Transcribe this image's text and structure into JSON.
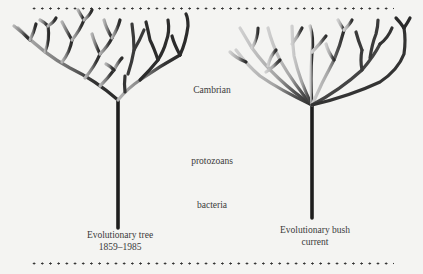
{
  "figure": {
    "eras": {
      "cambrian": "Cambrian",
      "protozoans": "protozoans",
      "bacteria": "bacteria"
    },
    "left_tree": {
      "title": "Evolutionary tree",
      "period": "1859–1985"
    },
    "right_tree": {
      "title": "Evolutionary bush",
      "period": "current"
    }
  },
  "colors": {
    "background": "#f4f4f2",
    "trunk": "#1e1e1e",
    "branch_dark": "#2a2a2a",
    "branch_mid": "#6a6a6a",
    "branch_light": "#aaaaaa",
    "dot_rule": "#333333"
  }
}
